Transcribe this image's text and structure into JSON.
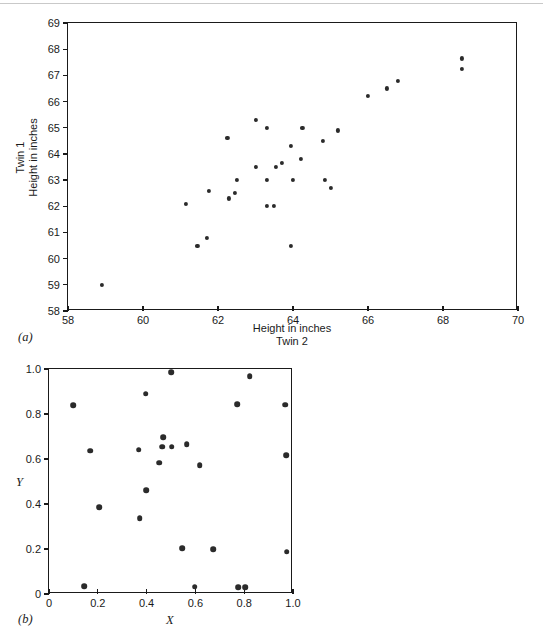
{
  "figure": {
    "panel_a_label": "(a)",
    "panel_b_label": "(b)"
  },
  "chart_data": [
    {
      "id": "panel-a",
      "type": "scatter",
      "title": "",
      "xlabel": "Height in inches\nTwin 2",
      "ylabel": "Twin 1\nHeight in inches",
      "xlim": [
        58,
        70
      ],
      "ylim": [
        58,
        69
      ],
      "xticks": [
        58,
        60,
        62,
        64,
        66,
        68,
        70
      ],
      "xticklabels": [
        "58",
        "60",
        "62",
        "64",
        "66",
        "68",
        "70"
      ],
      "yticks": [
        58,
        59,
        60,
        61,
        62,
        63,
        64,
        65,
        66,
        67,
        68,
        69
      ],
      "yticklabels": [
        "58",
        "59",
        "60",
        "61",
        "62",
        "63",
        "64",
        "65",
        "66",
        "67",
        "68",
        "69"
      ],
      "grid": false,
      "legend": null,
      "points": [
        [
          58.9,
          59.0
        ],
        [
          61.15,
          62.1
        ],
        [
          61.45,
          60.5
        ],
        [
          61.7,
          60.8
        ],
        [
          61.75,
          62.6
        ],
        [
          62.25,
          64.6
        ],
        [
          62.3,
          62.3
        ],
        [
          62.45,
          62.5
        ],
        [
          62.5,
          63.0
        ],
        [
          63.0,
          65.3
        ],
        [
          63.0,
          63.5
        ],
        [
          63.3,
          65.0
        ],
        [
          63.3,
          62.0
        ],
        [
          63.3,
          63.0
        ],
        [
          63.5,
          62.0
        ],
        [
          63.55,
          63.5
        ],
        [
          63.7,
          63.65
        ],
        [
          63.95,
          60.5
        ],
        [
          63.95,
          64.3
        ],
        [
          64.0,
          63.0
        ],
        [
          64.2,
          63.8
        ],
        [
          64.25,
          65.0
        ],
        [
          64.8,
          64.5
        ],
        [
          64.85,
          63.0
        ],
        [
          65.0,
          62.7
        ],
        [
          65.2,
          64.9
        ],
        [
          66.0,
          66.2
        ],
        [
          66.5,
          66.5
        ],
        [
          66.8,
          66.8
        ],
        [
          68.5,
          67.65
        ],
        [
          68.5,
          67.25
        ]
      ]
    },
    {
      "id": "panel-b",
      "type": "scatter",
      "title": "",
      "xlabel": "X",
      "ylabel": "Y",
      "xlim": [
        0,
        1.0
      ],
      "ylim": [
        0,
        1.0
      ],
      "xticks": [
        0,
        0.2,
        0.4,
        0.6,
        0.8,
        1.0
      ],
      "xticklabels": [
        "0",
        "0.2",
        "0.4",
        "0.6",
        "0.8",
        "1.0"
      ],
      "yticks": [
        0,
        0.2,
        0.4,
        0.6,
        0.8,
        1.0
      ],
      "yticklabels": [
        "0",
        "0.2",
        "0.4",
        "0.6",
        "0.8",
        "1.0"
      ],
      "grid": false,
      "legend": null,
      "points": [
        [
          0.1,
          0.84
        ],
        [
          0.145,
          0.035
        ],
        [
          0.17,
          0.637
        ],
        [
          0.205,
          0.386
        ],
        [
          0.368,
          0.641
        ],
        [
          0.372,
          0.337
        ],
        [
          0.397,
          0.891
        ],
        [
          0.398,
          0.462
        ],
        [
          0.452,
          0.584
        ],
        [
          0.463,
          0.654
        ],
        [
          0.468,
          0.697
        ],
        [
          0.5,
          0.985
        ],
        [
          0.503,
          0.655
        ],
        [
          0.545,
          0.204
        ],
        [
          0.565,
          0.665
        ],
        [
          0.597,
          0.032
        ],
        [
          0.617,
          0.573
        ],
        [
          0.672,
          0.198
        ],
        [
          0.772,
          0.844
        ],
        [
          0.775,
          0.03
        ],
        [
          0.805,
          0.029
        ],
        [
          0.822,
          0.968
        ],
        [
          0.968,
          0.841
        ],
        [
          0.972,
          0.616
        ],
        [
          0.975,
          0.188
        ]
      ]
    }
  ]
}
